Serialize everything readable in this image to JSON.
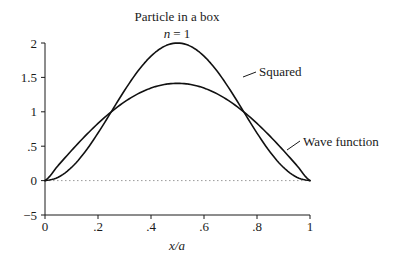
{
  "chart_data": {
    "type": "line",
    "title": "Particle in a box",
    "subtitle": "n = 1",
    "subtitle_var": "n",
    "subtitle_eq": "= 1",
    "xlabel": "x/a",
    "ylabel": "",
    "xlim": [
      0,
      1
    ],
    "ylim": [
      -0.5,
      2
    ],
    "x_ticks": [
      0,
      0.2,
      0.4,
      0.6,
      0.8,
      1
    ],
    "x_tick_labels": [
      "0",
      ".2",
      ".4",
      ".6",
      ".8",
      "1"
    ],
    "y_ticks": [
      -0.5,
      0,
      0.5,
      1,
      1.5,
      2
    ],
    "y_tick_labels": [
      "−5",
      "0",
      ".5",
      "1",
      "1.5",
      "2"
    ],
    "grid": false,
    "zero_line": "dotted",
    "x": [
      0,
      0.05,
      0.1,
      0.15,
      0.2,
      0.25,
      0.3,
      0.35,
      0.4,
      0.45,
      0.5,
      0.55,
      0.6,
      0.65,
      0.7,
      0.75,
      0.8,
      0.85,
      0.9,
      0.95,
      1
    ],
    "series": [
      {
        "name": "Wave function",
        "formula": "sqrt(2) * sin(pi * x)",
        "values": [
          0,
          0.221,
          0.437,
          0.642,
          0.831,
          1.0,
          1.144,
          1.26,
          1.345,
          1.397,
          1.414,
          1.397,
          1.345,
          1.26,
          1.144,
          1.0,
          0.831,
          0.642,
          0.437,
          0.221,
          0
        ]
      },
      {
        "name": "Squared",
        "formula": "2 * sin(pi * x)^2",
        "values": [
          0,
          0.049,
          0.191,
          0.412,
          0.691,
          1.0,
          1.309,
          1.588,
          1.809,
          1.951,
          2.0,
          1.951,
          1.809,
          1.588,
          1.309,
          1.0,
          0.691,
          0.412,
          0.191,
          0.049,
          0
        ]
      }
    ],
    "annotations": [
      {
        "text": "Squared",
        "target_series": "Squared"
      },
      {
        "text": "Wave function",
        "target_series": "Wave function"
      }
    ],
    "legend": "none (inline labels)"
  }
}
